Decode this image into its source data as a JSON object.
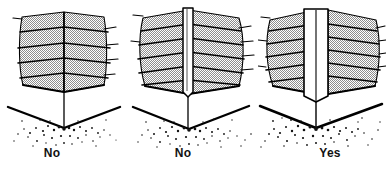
{
  "figure": {
    "title": "",
    "type": "technical-line-illustration",
    "background_color": "#ffffff",
    "ink_color": "#000000",
    "brush_fill_color": "#b3b3b3",
    "tool_fill_color": "#ffffff",
    "debris_color": "#111111"
  },
  "panels": [
    {
      "id": "panel-no-1",
      "label": "No",
      "verdict": "No",
      "brush_tiers": 5,
      "has_vertical_tool": false,
      "tool_width": 0,
      "description_semantic": "corner-brush-without-tool"
    },
    {
      "id": "panel-no-2",
      "label": "No",
      "verdict": "No",
      "brush_tiers": 5,
      "has_vertical_tool": true,
      "tool_width": 10,
      "description_semantic": "corner-brush-with-narrow-tool"
    },
    {
      "id": "panel-yes",
      "label": "Yes",
      "verdict": "Yes",
      "brush_tiers": 6,
      "has_vertical_tool": true,
      "tool_width": 24,
      "description_semantic": "corner-brush-with-wide-tool"
    }
  ]
}
